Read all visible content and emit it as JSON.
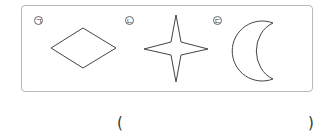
{
  "figures": [
    {
      "label": "ㄱ",
      "shape": "rhombus"
    },
    {
      "label": "ㄴ",
      "shape": "four-pointed-star"
    },
    {
      "label": "ㄷ",
      "shape": "crescent-moon"
    }
  ],
  "answer": {
    "open": "(",
    "close": ")",
    "value": ""
  },
  "colors": {
    "border": "#b8b8b8",
    "stroke": "#444444"
  }
}
